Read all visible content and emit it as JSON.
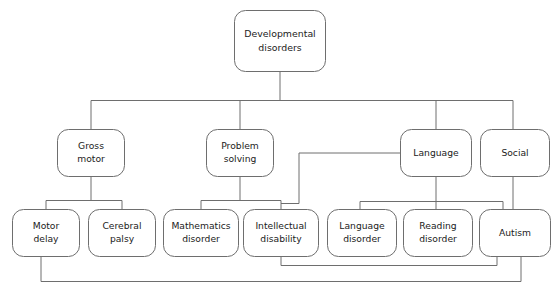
{
  "diagram": {
    "type": "tree-diagram",
    "stroke_color": "#6e6e6e",
    "text_color": "#1b1b1b",
    "background_color": "#ffffff",
    "nodes": {
      "root": {
        "id": "developmental-disorders",
        "line1": "Developmental",
        "line2": "disorders",
        "x": 234,
        "y": 10,
        "w": 92,
        "h": 62,
        "level": 0
      },
      "gross_motor": {
        "id": "gross-motor",
        "line1": "Gross",
        "line2": "motor",
        "x": 57,
        "y": 129,
        "w": 68,
        "h": 48,
        "level": 1
      },
      "problem_solving": {
        "id": "problem-solving",
        "line1": "Problem",
        "line2": "solving",
        "x": 206,
        "y": 129,
        "w": 68,
        "h": 48,
        "level": 1
      },
      "language": {
        "id": "language",
        "line1": "Language",
        "line2": "",
        "x": 400,
        "y": 129,
        "w": 72,
        "h": 48,
        "level": 1
      },
      "social": {
        "id": "social",
        "line1": "Social",
        "line2": "",
        "x": 480,
        "y": 129,
        "w": 70,
        "h": 48,
        "level": 1
      },
      "motor_delay": {
        "id": "motor-delay",
        "line1": "Motor",
        "line2": "delay",
        "x": 12,
        "y": 209,
        "w": 68,
        "h": 48,
        "level": 2
      },
      "cerebral_palsy": {
        "id": "cerebral-palsy",
        "line1": "Cerebral",
        "line2": "palsy",
        "x": 88,
        "y": 209,
        "w": 68,
        "h": 48,
        "level": 2
      },
      "mathematics_disorder": {
        "id": "mathematics-disorder",
        "line1": "Mathematics",
        "line2": "disorder",
        "x": 163,
        "y": 209,
        "w": 76,
        "h": 48,
        "level": 2
      },
      "intellectual_disability": {
        "id": "intellectual-disability",
        "line1": "Intellectual",
        "line2": "disability",
        "x": 243,
        "y": 209,
        "w": 76,
        "h": 48,
        "level": 2
      },
      "language_disorder": {
        "id": "language-disorder",
        "line1": "Language",
        "line2": "disorder",
        "x": 327,
        "y": 209,
        "w": 70,
        "h": 48,
        "level": 2
      },
      "reading_disorder": {
        "id": "reading-disorder",
        "line1": "Reading",
        "line2": "disorder",
        "x": 403,
        "y": 209,
        "w": 70,
        "h": 48,
        "level": 2
      },
      "autism": {
        "id": "autism",
        "line1": "Autism",
        "line2": "",
        "x": 479,
        "y": 209,
        "w": 72,
        "h": 48,
        "level": 2
      }
    },
    "edges": [
      {
        "id": "root-to-bus",
        "from": "developmental-disorders",
        "to": "level1-bus"
      },
      {
        "id": "bus-to-gross-motor",
        "from": "level1-bus",
        "to": "gross-motor"
      },
      {
        "id": "bus-to-problem-solving",
        "from": "level1-bus",
        "to": "problem-solving"
      },
      {
        "id": "bus-to-language",
        "from": "level1-bus",
        "to": "language"
      },
      {
        "id": "bus-to-social",
        "from": "level1-bus",
        "to": "social"
      },
      {
        "id": "gross-motor-to-motor-delay",
        "from": "gross-motor",
        "to": "motor-delay"
      },
      {
        "id": "gross-motor-to-cerebral-palsy",
        "from": "gross-motor",
        "to": "cerebral-palsy"
      },
      {
        "id": "problem-solving-to-mathematics-disorder",
        "from": "problem-solving",
        "to": "mathematics-disorder"
      },
      {
        "id": "problem-solving-to-intellectual-disability",
        "from": "problem-solving",
        "to": "intellectual-disability"
      },
      {
        "id": "language-to-language-disorder",
        "from": "language",
        "to": "language-disorder"
      },
      {
        "id": "language-to-reading-disorder",
        "from": "language",
        "to": "reading-disorder"
      },
      {
        "id": "language-to-autism",
        "from": "language",
        "to": "autism"
      },
      {
        "id": "language-to-intellectual-disability",
        "from": "language",
        "to": "intellectual-disability"
      },
      {
        "id": "social-to-autism",
        "from": "social",
        "to": "autism"
      },
      {
        "id": "intellectual-disability-to-autism-bus",
        "from": "intellectual-disability",
        "to": "autism"
      },
      {
        "id": "motor-delay-to-autism-bus",
        "from": "motor-delay",
        "to": "autism"
      }
    ]
  }
}
